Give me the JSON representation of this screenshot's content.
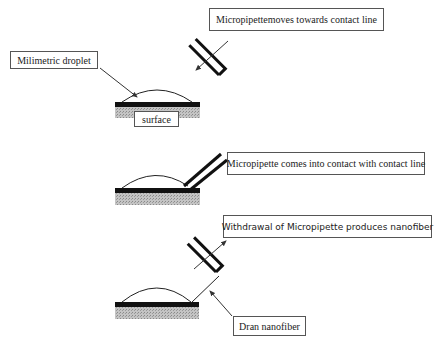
{
  "diagram": {
    "stages": [
      {
        "step": 1,
        "caption": "Micropipettemoves towards contact line",
        "droplet_label": "Milimetric droplet",
        "surface_label": "surface"
      },
      {
        "step": 2,
        "caption": "Micropipette comes into contact with contact line"
      },
      {
        "step": 3,
        "caption": "Withdrawal of Micropipette produces nanofiber",
        "fiber_label": "Dran nanofiber"
      }
    ],
    "colors": {
      "substrate_top": "#111111",
      "substrate_hatch": "#b8b8b8",
      "pipette": "#111111",
      "arrow": "#333333",
      "box_border": "#555555"
    }
  }
}
